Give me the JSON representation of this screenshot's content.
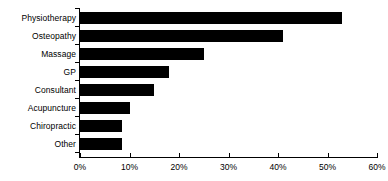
{
  "chart_data": {
    "type": "bar",
    "orientation": "horizontal",
    "title": "",
    "xlabel": "",
    "ylabel": "",
    "categories": [
      "Physiotherapy",
      "Osteopathy",
      "Massage",
      "GP",
      "Consultant",
      "Acupuncture",
      "Chiropractic",
      "Other"
    ],
    "values": [
      53,
      41,
      25,
      18,
      15,
      10,
      8.5,
      8.5
    ],
    "xlim": [
      0,
      60
    ],
    "xtick_values": [
      0,
      10,
      20,
      30,
      40,
      50,
      60
    ],
    "xtick_labels": [
      "0%",
      "10%",
      "20%",
      "30%",
      "40%",
      "50%",
      "60%"
    ],
    "grid": false,
    "legend": null,
    "bar_color": "#000000",
    "background_color": "#ffffff",
    "axis_color": "#000000"
  }
}
